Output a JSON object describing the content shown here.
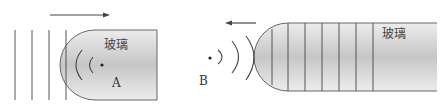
{
  "diagram": {
    "left_figure": {
      "material_label": "玻璃",
      "point_label": "A",
      "arrow_direction": "right",
      "wavefront_lines_outside": 4,
      "wavefront_arcs_inside": 2
    },
    "right_figure": {
      "material_label": "玻璃",
      "point_label": "B",
      "arrow_direction": "left",
      "wavefront_lines_inside": 7,
      "wavefront_arcs_outside": 3
    },
    "colors": {
      "glass_fill_center": "#c8c8c8",
      "glass_fill_edge": "#e8e8e8",
      "stroke": "#555555"
    }
  }
}
